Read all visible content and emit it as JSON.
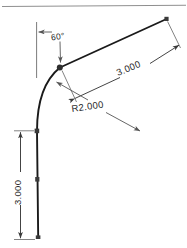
{
  "drawing": {
    "type": "cad-sketch-dimensioned-profile",
    "background_color": "#ffffff",
    "geometry_color": "#1a1a1a",
    "annotation_color": "#555555",
    "text_color": "#2b2b2b",
    "border_color": "#8a8a8a",
    "point_marker_color": "#3a3a3a"
  },
  "dimensions": {
    "angle": {
      "label": "60°",
      "name": "angle-dimension"
    },
    "line_length": {
      "label": "3.000",
      "name": "angled-linear-dimension"
    },
    "radius": {
      "label": "R2.000",
      "name": "radius-dimension"
    },
    "vertical_length": {
      "label": "3.000",
      "name": "vertical-linear-dimension"
    }
  },
  "entities": {
    "vertical_line_name": "vertical-geometry-line",
    "arc_name": "tangent-arc",
    "angled_line_name": "angled-geometry-line",
    "reference_line_name": "vertical-reference-line",
    "points": [
      "point-arc-start-bottom",
      "point-midline",
      "point-tangent",
      "point-line-end-top"
    ]
  }
}
